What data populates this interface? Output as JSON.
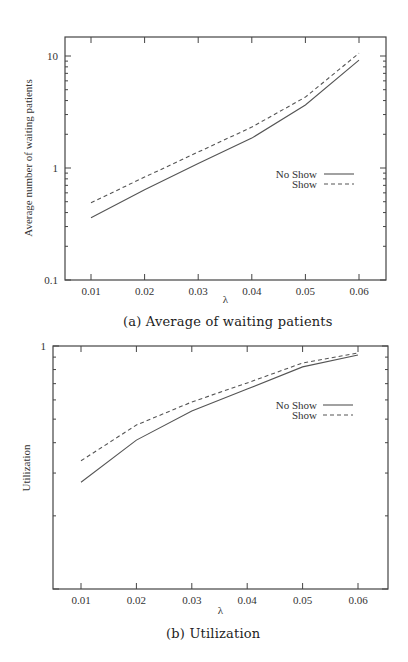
{
  "chart_data": [
    {
      "id": "a",
      "type": "line",
      "title": "",
      "caption": "(a) Average of waiting patients",
      "xlabel": "λ",
      "ylabel": "Average number of waiting patients",
      "yscale": "log",
      "ylim": [
        0.1,
        15
      ],
      "xlim": [
        0.005,
        0.065
      ],
      "x": [
        0.01,
        0.02,
        0.03,
        0.04,
        0.05,
        0.06
      ],
      "x_tick_labels": [
        "0.01",
        "0.02",
        "0.03",
        "0.04",
        "0.05",
        "0.06"
      ],
      "y_tick_labels": [
        "0.1",
        "1",
        "10"
      ],
      "y_tick_values": [
        0.1,
        1,
        10
      ],
      "grid": false,
      "legend_position": "right-center",
      "series": [
        {
          "name": "No Show",
          "style": "solid",
          "values": [
            0.36,
            0.64,
            1.1,
            1.85,
            3.65,
            9.2
          ]
        },
        {
          "name": "Show",
          "style": "dashed",
          "values": [
            0.49,
            0.83,
            1.39,
            2.32,
            4.3,
            10.6
          ]
        }
      ]
    },
    {
      "id": "b",
      "type": "line",
      "title": "",
      "caption": "(b) Utilization",
      "xlabel": "λ",
      "ylabel": "Utilization",
      "yscale": "log",
      "ylim": [
        0.1,
        1
      ],
      "xlim": [
        0.005,
        0.065
      ],
      "x": [
        0.01,
        0.02,
        0.03,
        0.04,
        0.05,
        0.06
      ],
      "x_tick_labels": [
        "0.01",
        "0.02",
        "0.03",
        "0.04",
        "0.05",
        "0.06"
      ],
      "y_tick_labels": [
        "1"
      ],
      "y_tick_values": [
        1
      ],
      "grid": false,
      "legend_position": "upper-right",
      "series": [
        {
          "name": "No Show",
          "style": "solid",
          "values": [
            0.275,
            0.41,
            0.54,
            0.665,
            0.82,
            0.918
          ]
        },
        {
          "name": "Show",
          "style": "dashed",
          "values": [
            0.337,
            0.473,
            0.588,
            0.705,
            0.851,
            0.936
          ]
        }
      ]
    }
  ],
  "captions": {
    "a": "(a) Average of waiting patients",
    "b": "(b) Utilization"
  },
  "legend": {
    "no_show": "No Show",
    "show": "Show"
  },
  "axes": {
    "x_label": "λ",
    "a_y_label": "Average number of waiting patients",
    "b_y_label": "Utilization"
  }
}
